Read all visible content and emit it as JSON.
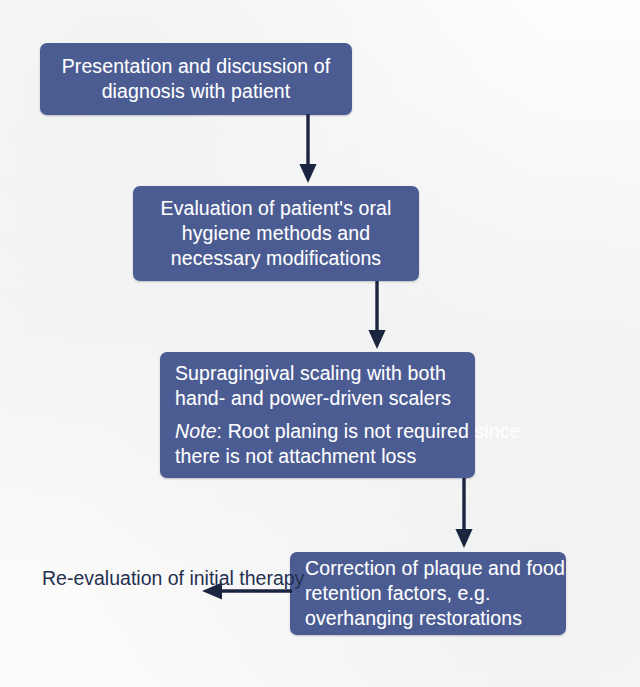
{
  "diagram": {
    "background_color": "#fbfbfa",
    "node_color": "#4b5c92",
    "node_text_color": "#ffffff",
    "arrow_color": "#1c2540",
    "label_text_color": "#24304f",
    "nodes": [
      {
        "id": "node-presentation",
        "align": "center",
        "lines": [
          "Presentation and discussion of",
          "diagnosis with patient"
        ]
      },
      {
        "id": "node-oral-hygiene",
        "align": "center",
        "lines": [
          "Evaluation of patient's oral",
          "hygiene methods and",
          "necessary modifications"
        ]
      },
      {
        "id": "node-scaling",
        "align": "left",
        "lines": [
          "Supragingival scaling with both",
          "hand- and power-driven scalers"
        ],
        "note_prefix": "Note",
        "note_colon": ":",
        "note_lines": [
          " Root planing is not required since",
          "there is not attachment loss"
        ]
      },
      {
        "id": "node-correction",
        "align": "left",
        "lines": [
          "Correction of plaque and food",
          "retention factors, e.g.",
          "overhanging restorations"
        ]
      }
    ],
    "labels": [
      {
        "id": "label-re-evaluation",
        "lines": [
          "Re-evaluation of",
          "initial therapy"
        ]
      }
    ],
    "connectors": [
      {
        "id": "arrow-1",
        "direction": "down",
        "from": "node-presentation",
        "to": "node-oral-hygiene"
      },
      {
        "id": "arrow-2",
        "direction": "down",
        "from": "node-oral-hygiene",
        "to": "node-scaling"
      },
      {
        "id": "arrow-3",
        "direction": "down",
        "from": "node-scaling",
        "to": "node-correction"
      },
      {
        "id": "arrow-4",
        "direction": "left",
        "from": "node-correction",
        "to": "label-re-evaluation"
      }
    ]
  }
}
